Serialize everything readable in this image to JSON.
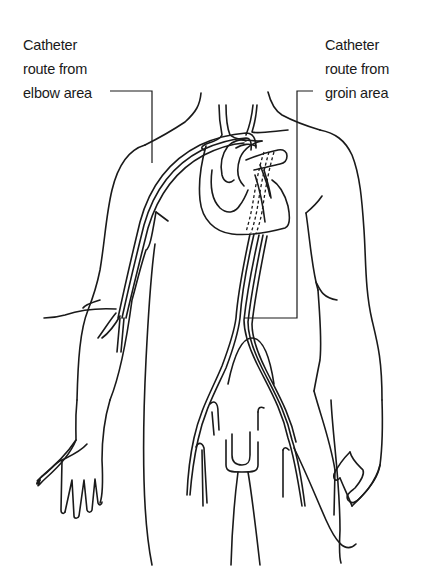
{
  "diagram": {
    "type": "medical-line-illustration",
    "labels": [
      {
        "id": "elbow",
        "lines": [
          "Catheter",
          "route from",
          "elbow area"
        ],
        "points_to": "catheter entering at elbow, running up arm to heart"
      },
      {
        "id": "groin",
        "lines": [
          "Catheter",
          "route from",
          "groin area"
        ],
        "points_to": "catheter entering at groin, running up aorta to heart"
      }
    ],
    "colors": {
      "line": "#1a1a1a",
      "background": "#ffffff"
    }
  }
}
